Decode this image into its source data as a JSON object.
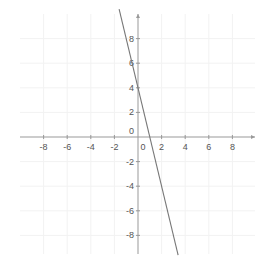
{
  "chart_data": {
    "type": "line",
    "title": "",
    "xlabel": "",
    "ylabel": "",
    "xlim": [
      -10,
      10.5
    ],
    "ylim": [
      -10,
      10.5
    ],
    "grid": true,
    "x_ticks": [
      -8,
      -6,
      -4,
      -2,
      0,
      2,
      4,
      6,
      8
    ],
    "y_ticks": [
      -8,
      -6,
      -4,
      -2,
      0,
      2,
      4,
      6,
      8
    ],
    "x_tick_labels": [
      "-8",
      "-6",
      "-4",
      "-2",
      "0",
      "2",
      "4",
      "6",
      "8"
    ],
    "y_tick_labels": [
      "-8",
      "-6",
      "-4",
      "-2",
      "0",
      "2",
      "4",
      "6",
      "8"
    ],
    "series": [
      {
        "name": "y = -4x + 4",
        "slope": -4,
        "intercept": 4,
        "x": [
          -1.6,
          3.4
        ],
        "y": [
          10.4,
          -9.6
        ],
        "color": "#777777"
      }
    ]
  },
  "colors": {
    "axis": "#999999",
    "grid": "#f2f2f2",
    "line": "#777777",
    "label": "#555555"
  }
}
